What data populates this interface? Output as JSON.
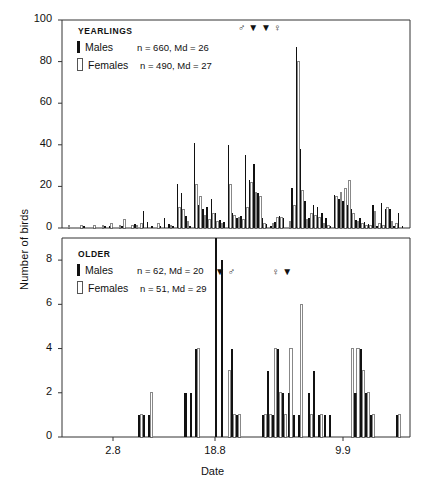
{
  "axes": {
    "ylabel": "Number of birds",
    "xlabel": "Date",
    "xticks": [
      "2.8",
      "18.8",
      "9.9"
    ],
    "upper_yticks": [
      "0",
      "20",
      "40",
      "60",
      "80",
      "100"
    ],
    "lower_yticks": [
      "0",
      "2",
      "4",
      "6",
      "8"
    ]
  },
  "panels": {
    "upper": {
      "title": "YEARLINGS",
      "males_label": "Males",
      "males_stats": "n = 660, Md = 26",
      "females_label": "Females",
      "females_stats": "n = 490, Md = 27",
      "markers": "♂ ▼ ▼ ♀"
    },
    "lower": {
      "title": "OLDER",
      "males_label": "Males",
      "males_stats": "n = 62, Md = 20",
      "females_label": "Females",
      "females_stats": "n = 51, Md = 29",
      "marker_left": "▼ ♂",
      "marker_right": "♀ ▼"
    }
  },
  "colors": {
    "males": "#111111",
    "females": "#ffffff",
    "female_outline": "#555555",
    "axis": "#333333"
  },
  "chart_data": {
    "type": "bar",
    "xlabel": "Date",
    "ylabel": "Number of birds",
    "grid": false,
    "legend_position": "top-left inside panels",
    "panels": [
      {
        "name": "YEARLINGS",
        "ylim": [
          0,
          100
        ],
        "ytick_step": 20,
        "series": [
          {
            "name": "Males",
            "n": 660,
            "median": 26,
            "color": "#111111",
            "values": [
              0,
              0,
              0,
              0,
              1,
              0,
              0,
              0,
              0,
              1,
              1,
              0,
              0,
              1,
              0,
              0,
              2,
              0,
              8,
              3,
              1,
              0,
              1,
              5,
              2,
              1,
              21,
              17,
              6,
              1,
              41,
              11,
              9,
              10,
              14,
              7,
              4,
              3,
              40,
              7,
              5,
              6,
              35,
              23,
              31,
              17,
              5,
              2,
              1,
              3,
              6,
              5,
              0,
              19,
              87,
              38,
              13,
              5,
              11,
              10,
              7,
              5,
              1,
              16,
              14,
              13,
              11,
              9,
              4,
              5,
              3,
              2,
              11,
              1,
              12,
              9,
              9,
              1,
              7,
              1
            ]
          },
          {
            "name": "Females",
            "n": 490,
            "median": 27,
            "color": "#ffffff",
            "values": [
              1,
              0,
              0,
              1,
              0,
              0,
              1,
              0,
              1,
              0,
              2,
              0,
              1,
              4,
              0,
              1,
              1,
              2,
              0,
              0,
              0,
              2,
              0,
              0,
              1,
              0,
              10,
              9,
              3,
              0,
              21,
              15,
              6,
              4,
              7,
              3,
              2,
              0,
              21,
              6,
              5,
              4,
              10,
              22,
              17,
              15,
              2,
              0,
              2,
              5,
              5,
              0,
              3,
              11,
              80,
              18,
              4,
              7,
              6,
              5,
              2,
              1,
              0,
              15,
              17,
              19,
              23,
              7,
              3,
              2,
              1,
              1,
              8,
              2,
              1,
              10,
              3,
              2,
              0,
              0
            ]
          }
        ]
      },
      {
        "name": "OLDER",
        "ylim": [
          0,
          9
        ],
        "ytick_step": 2,
        "series": [
          {
            "name": "Males",
            "n": 62,
            "median": 20,
            "color": "#111111",
            "values": [
              0,
              0,
              0,
              0,
              0,
              0,
              0,
              0,
              0,
              0,
              0,
              0,
              0,
              0,
              1,
              1,
              1,
              0,
              0,
              0,
              0,
              0,
              0,
              2,
              2,
              4,
              0,
              0,
              0,
              9,
              8,
              0,
              4,
              1,
              0,
              0,
              0,
              0,
              1,
              3,
              1,
              4,
              2,
              2,
              1,
              1,
              0,
              2,
              3,
              1,
              1,
              1,
              0,
              0,
              0,
              0,
              2,
              4,
              2,
              1,
              0,
              0,
              0,
              0,
              1,
              0
            ]
          },
          {
            "name": "Females",
            "n": 51,
            "median": 29,
            "color": "#ffffff",
            "values": [
              0,
              0,
              0,
              0,
              0,
              0,
              0,
              0,
              0,
              0,
              0,
              0,
              0,
              0,
              1,
              0,
              2,
              0,
              0,
              0,
              0,
              0,
              0,
              0,
              0,
              4,
              0,
              0,
              0,
              0,
              0,
              3,
              1,
              1,
              0,
              0,
              0,
              0,
              1,
              1,
              4,
              2,
              1,
              4,
              0,
              6,
              0,
              1,
              0,
              1,
              0,
              0,
              0,
              0,
              0,
              4,
              4,
              3,
              2,
              1,
              0,
              0,
              0,
              0,
              1,
              0
            ]
          }
        ]
      }
    ]
  }
}
